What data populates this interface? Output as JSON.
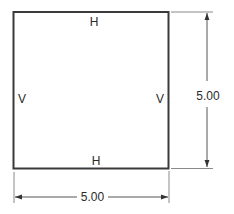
{
  "diagram": {
    "square": {
      "x": 13.5,
      "y": 12,
      "width": 155,
      "height": 156.5,
      "stroke": "#3a3a3a",
      "stroke_width": 2
    },
    "edge_labels": {
      "top": "H",
      "bottom": "H",
      "left": "V",
      "right": "V"
    },
    "dimensions": {
      "width": {
        "value": "5.00"
      },
      "height": {
        "value": "5.00"
      }
    },
    "colors": {
      "outline": "#3a3a3a",
      "dimension_line": "#555555",
      "extension_line": "#8a8a8a",
      "text": "#2a2a2a"
    }
  }
}
